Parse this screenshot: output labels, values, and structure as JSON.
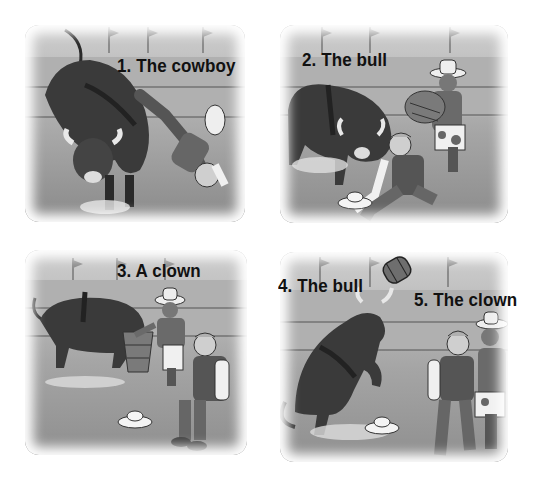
{
  "illustration": {
    "description": "Four-panel grayscale rodeo comic strip",
    "panels": [
      {
        "number": 1,
        "labels": [
          {
            "text": "1. The cowboy"
          }
        ],
        "scene": "bull bucking, cowboy falling head-first"
      },
      {
        "number": 2,
        "labels": [
          {
            "text": "2. The bull"
          }
        ],
        "scene": "bull charging, cowboy sitting on ground, clown running with barrel"
      },
      {
        "number": 3,
        "labels": [
          {
            "text": "3. A clown"
          }
        ],
        "scene": "clown distracting bull with barrel, cowboy sitting"
      },
      {
        "number": 4,
        "labels": [
          {
            "text": "4. The bull"
          },
          {
            "text": "5. The clown"
          }
        ],
        "scene": "bull rearing, barrel flying, clown helping cowboy walk away"
      }
    ],
    "colors": {
      "background": "#ffffff",
      "arena_wall": "#b5b5b5",
      "arena_ground": "#8f8f8f",
      "bull": "#3a3a3a",
      "label_text": "#111111"
    }
  }
}
